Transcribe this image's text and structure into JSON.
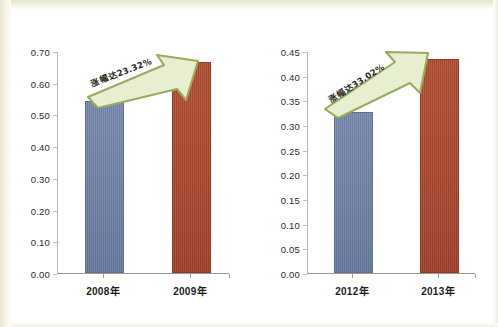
{
  "figure": {
    "background_color": "#ffffff",
    "scan_border_color": "#e9e7cf"
  },
  "palette": {
    "bar_blue": "#6e7fa4",
    "bar_red": "#a9452c",
    "axis_gray": "#9a9a9a",
    "arrow_fill": "#e8eed0",
    "arrow_stroke": "#9aab5e",
    "text_dark": "#1c1c1c"
  },
  "chart_data": [
    {
      "type": "bar",
      "title": "",
      "xlabel": "",
      "ylabel": "",
      "categories": [
        "2008年",
        "2009年"
      ],
      "values": [
        0.535,
        0.66
      ],
      "series": [
        {
          "name": "年度值",
          "values": [
            0.535,
            0.66
          ],
          "colors": [
            "#6e7fa4",
            "#a9452c"
          ]
        }
      ],
      "ylim": [
        0.0,
        0.7
      ],
      "ytick_step": 0.1,
      "ytick_labels": [
        "0.00",
        "0.10",
        "0.20",
        "0.30",
        "0.40",
        "0.50",
        "0.60",
        "0.70"
      ],
      "ytick_values": [
        0.0,
        0.1,
        0.2,
        0.3,
        0.4,
        0.5,
        0.6,
        0.7
      ],
      "grid": false,
      "legend": "none",
      "annotation": {
        "text": "涨幅达23.32%",
        "percent": "23.32%",
        "shape": "upward-arrow"
      }
    },
    {
      "type": "bar",
      "title": "",
      "xlabel": "",
      "ylabel": "",
      "categories": [
        "2012年",
        "2013年"
      ],
      "values": [
        0.323,
        0.429
      ],
      "series": [
        {
          "name": "年度值",
          "values": [
            0.323,
            0.429
          ],
          "colors": [
            "#6e7fa4",
            "#a9452c"
          ]
        }
      ],
      "ylim": [
        0.0,
        0.45
      ],
      "ytick_step": 0.05,
      "ytick_labels": [
        "0.00",
        "0.05",
        "0.10",
        "0.15",
        "0.20",
        "0.25",
        "0.30",
        "0.35",
        "0.40",
        "0.45"
      ],
      "ytick_values": [
        0.0,
        0.05,
        0.1,
        0.15,
        0.2,
        0.25,
        0.3,
        0.35,
        0.4,
        0.45
      ],
      "grid": false,
      "legend": "none",
      "annotation": {
        "text": "涨幅达33.02%",
        "percent": "33.02%",
        "shape": "upward-arrow"
      }
    }
  ]
}
